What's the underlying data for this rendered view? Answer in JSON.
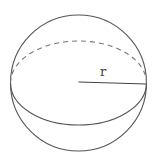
{
  "diagram": {
    "type": "sphere",
    "radius_label": "r",
    "colors": {
      "stroke": "#555555",
      "dashed": "#777777",
      "background": "#ffffff"
    },
    "geometry": {
      "center_x": 78.5,
      "center_y": 83,
      "radius": 68,
      "equator_ry": 42
    }
  }
}
